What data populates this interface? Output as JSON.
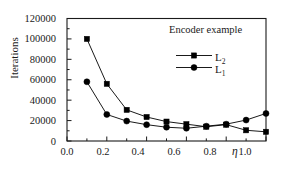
{
  "chart_data": {
    "type": "line",
    "title": "Encoder example",
    "xlabel": "η",
    "ylabel": "Iterations",
    "xlim": [
      0.0,
      1.0
    ],
    "ylim": [
      0,
      120000
    ],
    "xticks": [
      "0.0",
      "0.2",
      "0.4",
      "0.6",
      "0.8",
      "1.0"
    ],
    "xtick_values": [
      0.0,
      0.2,
      0.4,
      0.6,
      0.8,
      1.0
    ],
    "yticks": [
      "0",
      "20000",
      "40000",
      "60000",
      "80000",
      "100000",
      "120000"
    ],
    "ytick_values": [
      0,
      20000,
      40000,
      60000,
      80000,
      100000,
      120000
    ],
    "grid": false,
    "legend_position": "upper-center-right",
    "x": [
      0.1,
      0.2,
      0.3,
      0.4,
      0.5,
      0.6,
      0.7,
      0.8,
      0.9,
      1.0
    ],
    "series": [
      {
        "name": "L2",
        "label": "L",
        "subscript": "2",
        "marker": "square",
        "color": "#000000",
        "values": [
          100000,
          56000,
          30500,
          23500,
          19000,
          16500,
          14000,
          16000,
          10500,
          9000
        ]
      },
      {
        "name": "L1",
        "label": "L",
        "subscript": "1",
        "marker": "circle",
        "color": "#000000",
        "values": [
          58000,
          26000,
          19500,
          16000,
          13500,
          12500,
          14500,
          16500,
          20500,
          27000
        ]
      }
    ]
  },
  "figure": {
    "frame_color": "#1a1a1a",
    "background": "#ffffff"
  }
}
